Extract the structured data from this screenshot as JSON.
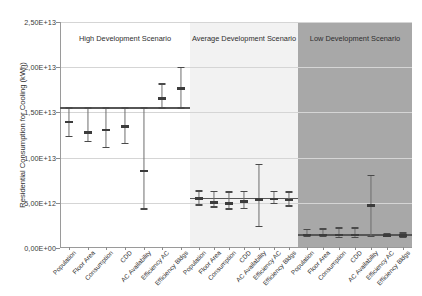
{
  "chart_data": {
    "type": "bar",
    "title": "",
    "xlabel": "",
    "ylabel": "Residential Consumption for Cooling (kWh)",
    "ylim": [
      0,
      25000000000000.0
    ],
    "yticks": [
      0,
      5000000000000.0,
      10000000000000.0,
      15000000000000.0,
      20000000000000.0,
      25000000000000.0
    ],
    "ytick_labels": [
      "0,00E+00",
      "5,00E+12",
      "1,00E+13",
      "1,50E+13",
      "2,00E+13",
      "2,50E+13"
    ],
    "grid": true,
    "legend": "none",
    "categories": [
      "Population",
      "Floor Area",
      "Consumption",
      "CDD",
      "AC Availability",
      "Efficiency AC",
      "Efficiency Bldgs"
    ],
    "panels": [
      {
        "name": "High Development Scenario",
        "background": "#ffffff",
        "baseline": 15500000000000.0,
        "series": [
          {
            "name": "Population",
            "mean": 13950000000000.0,
            "low": 12350000000000.0,
            "high": 15500000000000.0
          },
          {
            "name": "Floor Area",
            "mean": 12750000000000.0,
            "low": 11750000000000.0,
            "high": 15500000000000.0
          },
          {
            "name": "Consumption",
            "mean": 13050000000000.0,
            "low": 11150000000000.0,
            "high": 15500000000000.0
          },
          {
            "name": "CDD",
            "mean": 13450000000000.0,
            "low": 11550000000000.0,
            "high": 15500000000000.0
          },
          {
            "name": "AC Availability",
            "mean": 8500000000000.0,
            "low": 4300000000000.0,
            "high": 15500000000000.0
          },
          {
            "name": "Efficiency AC",
            "mean": 16550000000000.0,
            "low": 15500000000000.0,
            "high": 18150000000000.0
          },
          {
            "name": "Efficiency Bldgs",
            "mean": 17650000000000.0,
            "low": 15500000000000.0,
            "high": 19950000000000.0
          }
        ]
      },
      {
        "name": "Average Development Scenario",
        "background": "#f2f2f2",
        "baseline": 5500000000000.0,
        "series": [
          {
            "name": "Population",
            "mean": 5450000000000.0,
            "low": 4750000000000.0,
            "high": 6300000000000.0
          },
          {
            "name": "Floor Area",
            "mean": 5050000000000.0,
            "low": 4550000000000.0,
            "high": 6250000000000.0
          },
          {
            "name": "Consumption",
            "mean": 4950000000000.0,
            "low": 4300000000000.0,
            "high": 6200000000000.0
          },
          {
            "name": "CDD",
            "mean": 5150000000000.0,
            "low": 4350000000000.0,
            "high": 6250000000000.0
          },
          {
            "name": "AC Availability",
            "mean": 5350000000000.0,
            "low": 2350000000000.0,
            "high": 9250000000000.0
          },
          {
            "name": "Efficiency AC",
            "mean": 5400000000000.0,
            "low": 4950000000000.0,
            "high": 6250000000000.0
          },
          {
            "name": "Efficiency Bldgs",
            "mean": 5300000000000.0,
            "low": 4650000000000.0,
            "high": 6200000000000.0
          }
        ]
      },
      {
        "name": "Low Development Scenario",
        "background": "#a8a8a8",
        "baseline": 1450000000000.0,
        "series": [
          {
            "name": "Population",
            "mean": 1450000000000.0,
            "low": 1250000000000.0,
            "high": 2050000000000.0
          },
          {
            "name": "Floor Area",
            "mean": 1450000000000.0,
            "low": 1250000000000.0,
            "high": 2100000000000.0
          },
          {
            "name": "Consumption",
            "mean": 1450000000000.0,
            "low": 1200000000000.0,
            "high": 2200000000000.0
          },
          {
            "name": "CDD",
            "mean": 1450000000000.0,
            "low": 1200000000000.0,
            "high": 2200000000000.0
          },
          {
            "name": "AC Availability",
            "mean": 4700000000000.0,
            "low": 1300000000000.0,
            "high": 8050000000000.0
          },
          {
            "name": "Efficiency AC",
            "mean": 1400000000000.0,
            "low": 1250000000000.0,
            "high": 1600000000000.0
          },
          {
            "name": "Efficiency Bldgs",
            "mean": 1400000000000.0,
            "low": 1200000000000.0,
            "high": 1650000000000.0
          }
        ]
      }
    ]
  },
  "colors": {
    "gridline": "#d5d5d5",
    "axis": "#9a9a9a",
    "marker": "#3c3c3c",
    "whisker": "#6e6e6e",
    "baseline": "#565656"
  }
}
